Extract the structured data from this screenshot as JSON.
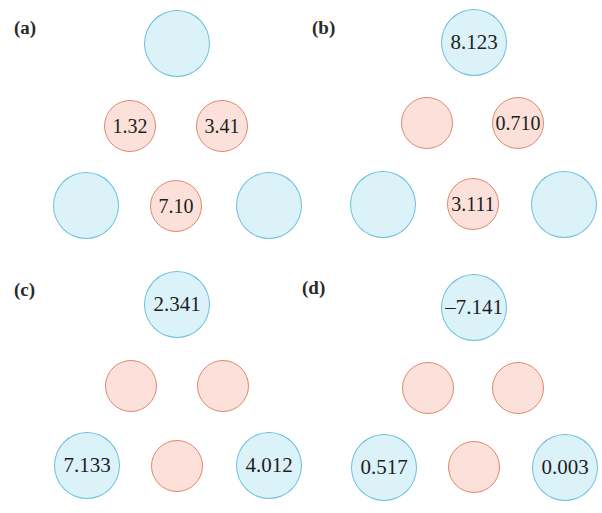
{
  "colors": {
    "blue_fill": "#dbf2f9",
    "blue_stroke": "#6bbfdc",
    "red_fill": "#fbe1d9",
    "red_stroke": "#e2886e"
  },
  "panels": [
    {
      "label": "(a)",
      "blue_top": "",
      "red_mid_left": "1.32",
      "red_mid_right": "3.41",
      "blue_bottom_left": "",
      "red_bottom": "7.10",
      "blue_bottom_right": ""
    },
    {
      "label": "(b)",
      "blue_top": "8.123",
      "red_mid_left": "",
      "red_mid_right": "0.710",
      "blue_bottom_left": "",
      "red_bottom": "3.111",
      "blue_bottom_right": ""
    },
    {
      "label": "(c)",
      "blue_top": "2.341",
      "red_mid_left": "",
      "red_mid_right": "",
      "blue_bottom_left": "7.133",
      "red_bottom": "",
      "blue_bottom_right": "4.012"
    },
    {
      "label": "(d)",
      "blue_top": "–7.141",
      "red_mid_left": "",
      "red_mid_right": "",
      "blue_bottom_left": "0.517",
      "red_bottom": "",
      "blue_bottom_right": "0.003"
    }
  ]
}
